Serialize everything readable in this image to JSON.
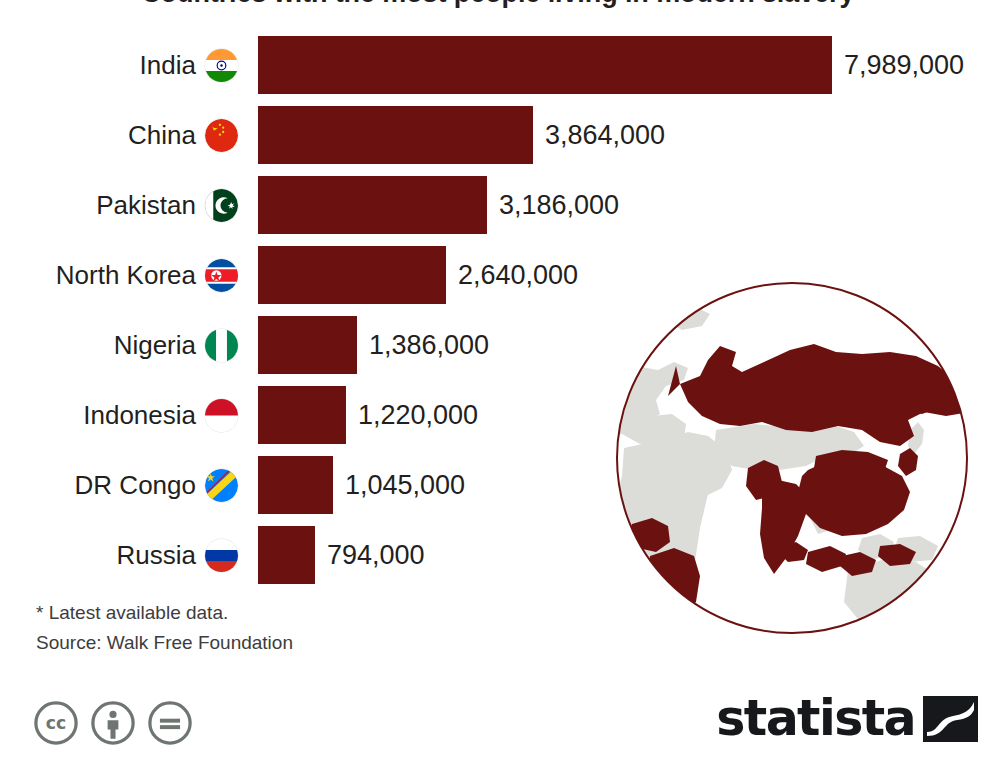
{
  "title": "Countries with the most people living in modern slavery*",
  "chart_data": {
    "type": "bar",
    "orientation": "horizontal",
    "title": "Countries with the most people living in modern slavery*",
    "xlabel": "",
    "ylabel": "",
    "categories": [
      "India",
      "China",
      "Pakistan",
      "North Korea",
      "Nigeria",
      "Indonesia",
      "DR Congo",
      "Russia"
    ],
    "values": [
      7989000,
      3864000,
      3186000,
      2640000,
      1386000,
      1220000,
      1045000,
      794000
    ],
    "value_labels": [
      "7,989,000",
      "3,864,000",
      "3,186,000",
      "2,640,000",
      "1,386,000",
      "1,220,000",
      "1,045,000",
      "794,000"
    ],
    "xlim": [
      0,
      7989000
    ],
    "grid": false,
    "legend": false,
    "bar_color": "#6b1211"
  },
  "rows": [
    {
      "country": "India",
      "flag": "flag-india",
      "value_label": "7,989,000",
      "value": 7989000,
      "bar_width_px": 574
    },
    {
      "country": "China",
      "flag": "flag-china",
      "value_label": "3,864,000",
      "value": 3864000,
      "bar_width_px": 275
    },
    {
      "country": "Pakistan",
      "flag": "flag-pakistan",
      "value_label": "3,186,000",
      "value": 3186000,
      "bar_width_px": 229
    },
    {
      "country": "North Korea",
      "flag": "flag-north-korea",
      "value_label": "2,640,000",
      "value": 2640000,
      "bar_width_px": 188
    },
    {
      "country": "Nigeria",
      "flag": "flag-nigeria",
      "value_label": "1,386,000",
      "value": 1386000,
      "bar_width_px": 99
    },
    {
      "country": "Indonesia",
      "flag": "flag-indonesia",
      "value_label": "1,220,000",
      "value": 1220000,
      "bar_width_px": 88
    },
    {
      "country": "DR Congo",
      "flag": "flag-dr-congo",
      "value_label": "1,045,000",
      "value": 1045000,
      "bar_width_px": 75
    },
    {
      "country": "Russia",
      "flag": "flag-russia",
      "value_label": "794,000",
      "value": 794000,
      "bar_width_px": 57
    }
  ],
  "notes": {
    "footnote": "* Latest available data.",
    "source": "Source: Walk Free Foundation"
  },
  "license": {
    "badges": [
      "cc-icon",
      "cc-by-icon",
      "cc-nd-icon"
    ]
  },
  "brand": {
    "name": "statista",
    "mark": "statista-swoosh-icon"
  },
  "colors": {
    "bar": "#6b1211",
    "text": "#231f20",
    "note_text": "#3d3d3d",
    "globe_outline": "#6b1211",
    "globe_land": "#dcddd9",
    "globe_highlight": "#6b1211",
    "background": "#ffffff"
  },
  "globe": {
    "name": "world-globe-illustration",
    "highlighted_countries": [
      "Russia",
      "China",
      "India",
      "Pakistan",
      "North Korea",
      "Indonesia",
      "Nigeria",
      "DR Congo"
    ]
  }
}
